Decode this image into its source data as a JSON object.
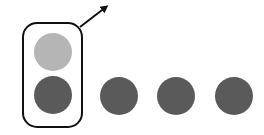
{
  "diagram": {
    "colors": {
      "light_circle": "#b5b5b5",
      "dark_circle": "#5a5a5a",
      "outline": "#111111",
      "background": "#ffffff"
    },
    "group": {
      "circles": [
        {
          "cx": 53,
          "cy": 52,
          "r": 19,
          "shade": "light"
        },
        {
          "cx": 53,
          "cy": 95,
          "r": 19,
          "shade": "dark"
        }
      ]
    },
    "loose_circles": [
      {
        "cx": 119,
        "cy": 96,
        "r": 19,
        "shade": "dark"
      },
      {
        "cx": 176,
        "cy": 96,
        "r": 19,
        "shade": "dark"
      },
      {
        "cx": 234,
        "cy": 96,
        "r": 19,
        "shade": "dark"
      }
    ]
  }
}
